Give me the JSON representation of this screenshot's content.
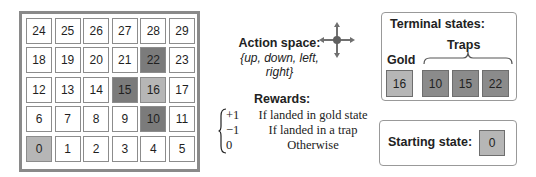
{
  "grid": {
    "rows": [
      [
        {
          "label": "24",
          "type": "normal"
        },
        {
          "label": "25",
          "type": "normal"
        },
        {
          "label": "26",
          "type": "normal"
        },
        {
          "label": "27",
          "type": "normal"
        },
        {
          "label": "28",
          "type": "normal"
        },
        {
          "label": "29",
          "type": "normal"
        }
      ],
      [
        {
          "label": "18",
          "type": "normal"
        },
        {
          "label": "19",
          "type": "normal"
        },
        {
          "label": "20",
          "type": "normal"
        },
        {
          "label": "21",
          "type": "normal"
        },
        {
          "label": "22",
          "type": "trap"
        },
        {
          "label": "23",
          "type": "normal"
        }
      ],
      [
        {
          "label": "12",
          "type": "normal"
        },
        {
          "label": "13",
          "type": "normal"
        },
        {
          "label": "14",
          "type": "normal"
        },
        {
          "label": "15",
          "type": "trap"
        },
        {
          "label": "16",
          "type": "gold"
        },
        {
          "label": "17",
          "type": "normal"
        }
      ],
      [
        {
          "label": "6",
          "type": "normal"
        },
        {
          "label": "7",
          "type": "normal"
        },
        {
          "label": "8",
          "type": "normal"
        },
        {
          "label": "9",
          "type": "normal"
        },
        {
          "label": "10",
          "type": "trap"
        },
        {
          "label": "11",
          "type": "normal"
        }
      ],
      [
        {
          "label": "0",
          "type": "start"
        },
        {
          "label": "1",
          "type": "normal"
        },
        {
          "label": "2",
          "type": "normal"
        },
        {
          "label": "3",
          "type": "normal"
        },
        {
          "label": "4",
          "type": "normal"
        },
        {
          "label": "5",
          "type": "normal"
        }
      ]
    ]
  },
  "action_space": {
    "title": "Action space:",
    "set": "{up, down, left, right}",
    "icon": "four-way-arrow-icon"
  },
  "rewards": {
    "title": "Rewards:",
    "cases": [
      {
        "value": "+1",
        "condition": "If landed in gold state"
      },
      {
        "value": "−1",
        "condition": "If landed in a trap"
      },
      {
        "value": "0",
        "condition": "Otherwise"
      }
    ]
  },
  "terminal_states": {
    "title": "Terminal states:",
    "gold_label": "Gold",
    "traps_label": "Traps",
    "gold": "16",
    "traps": [
      "10",
      "15",
      "22"
    ]
  },
  "starting_state": {
    "label": "Starting state:",
    "value": "0"
  },
  "colors": {
    "trap": "#7b7b7b",
    "gold": "#b6b6b6",
    "start": "#b6b6b6",
    "border": "#8c8c8c"
  }
}
